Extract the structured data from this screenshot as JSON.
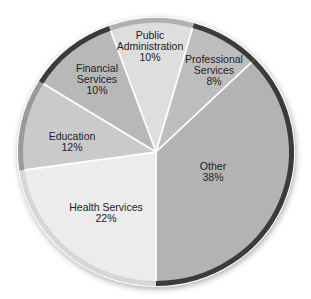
{
  "chart_data": {
    "type": "pie",
    "title": "",
    "slices": [
      {
        "label": "Public Administration",
        "value": 10,
        "display": "10%",
        "color": "#dedede",
        "rim": "#b0b0b0",
        "start": 340,
        "end": 16,
        "label_lines": [
          "Public",
          "Administration",
          "10%"
        ],
        "lx": 150,
        "ly": 46
      },
      {
        "label": "Professional Services",
        "value": 8,
        "display": "8%",
        "color": "#bdbdbd",
        "rim": "#3a3a3a",
        "start": 16,
        "end": 46,
        "label_lines": [
          "Professional",
          "Services",
          "8%"
        ],
        "lx": 214,
        "ly": 70
      },
      {
        "label": "Other",
        "value": 38,
        "display": "38%",
        "color": "#b3b3b3",
        "rim": "#3a3a3a",
        "start": 46,
        "end": 180,
        "label_lines": [
          "Other",
          "38%"
        ],
        "lx": 213,
        "ly": 172
      },
      {
        "label": "Health Services",
        "value": 22,
        "display": "22%",
        "color": "#ececec",
        "rim": "#d6d6d6",
        "start": 180,
        "end": 262,
        "label_lines": [
          "Health Services",
          "22%"
        ],
        "lx": 106,
        "ly": 213
      },
      {
        "label": "Education",
        "value": 12,
        "display": "12%",
        "color": "#cacaca",
        "rim": "#9a9a9a",
        "start": 262,
        "end": 302,
        "label_lines": [
          "Education",
          "12%"
        ],
        "lx": 72,
        "ly": 142
      },
      {
        "label": "Financial Services",
        "value": 10,
        "display": "10%",
        "color": "#b8b8b8",
        "rim": "#3a3a3a",
        "start": 302,
        "end": 340,
        "label_lines": [
          "Financial",
          "Services",
          "10%"
        ],
        "lx": 97,
        "ly": 79
      }
    ],
    "center": [
      156,
      152
    ],
    "radius": [
      138,
      134
    ],
    "legend": "none",
    "labels_inside": true
  }
}
